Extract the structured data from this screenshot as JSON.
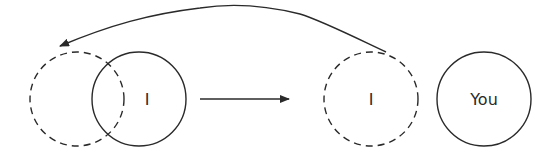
{
  "diagram": {
    "stroke_color": "#2a2a2a",
    "background": "#ffffff",
    "nodes": [
      {
        "id": "former-self-ghost",
        "label": "",
        "style": "dashed",
        "cx": 77,
        "cy": 99,
        "r": 47
      },
      {
        "id": "self",
        "label": "I",
        "style": "solid",
        "cx": 139,
        "cy": 99,
        "r": 47
      },
      {
        "id": "projected-self",
        "label": "I",
        "style": "dashed",
        "cx": 371,
        "cy": 99,
        "r": 47
      },
      {
        "id": "other",
        "label": "You",
        "style": "solid",
        "cx": 484,
        "cy": 99,
        "r": 47
      }
    ],
    "edges": [
      {
        "id": "move-arrow",
        "from": "self",
        "to": "projected-self",
        "type": "straight"
      },
      {
        "id": "return-arrow",
        "from": "projected-self",
        "to": "former-self-ghost",
        "type": "curved"
      }
    ]
  }
}
